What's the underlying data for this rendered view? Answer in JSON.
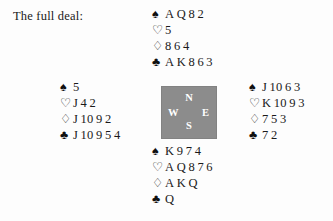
{
  "caption": "The full deal:",
  "suit_symbols": {
    "spades": "♠",
    "hearts": "♡",
    "diamonds": "♢",
    "clubs": "♣"
  },
  "compass": {
    "north": "N",
    "west": "W",
    "east": "E",
    "south": "S",
    "background_color": "#8c8c8c",
    "label_color": "#ffffff"
  },
  "colors": {
    "background": "#fdfdfd",
    "text": "#1a1a1a"
  },
  "hands": {
    "north": {
      "position_label": "North",
      "spades": "A Q 8 2",
      "hearts": "5",
      "diamonds": "8 6 4",
      "clubs": "A K 8 6 3"
    },
    "west": {
      "position_label": "West",
      "spades": "5",
      "hearts": "J 4 2",
      "diamonds": "J 10 9 2",
      "clubs": "J 10 9 5 4"
    },
    "east": {
      "position_label": "East",
      "spades": "J 10 6 3",
      "hearts": "K 10 9 3",
      "diamonds": "7 5 3",
      "clubs": "7 2"
    },
    "south": {
      "position_label": "South",
      "spades": "K 9 7 4",
      "hearts": "A Q 8 7 6",
      "diamonds": "A K Q",
      "clubs": "Q"
    }
  }
}
